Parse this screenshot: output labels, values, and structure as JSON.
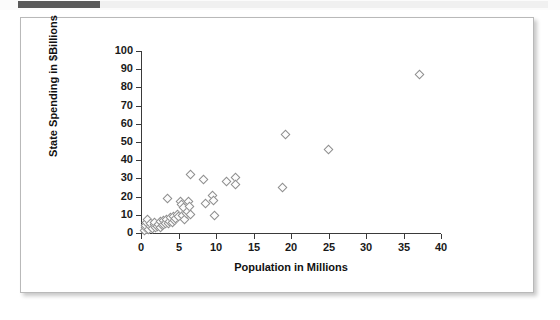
{
  "header": {
    "strip_label": ""
  },
  "chart_data": {
    "type": "scatter",
    "title": "",
    "xlabel": "Population in Millions",
    "ylabel": "State Spending in $Billions",
    "xlim": [
      0,
      40
    ],
    "ylim": [
      0,
      100
    ],
    "xticks": [
      0,
      5,
      10,
      15,
      20,
      25,
      30,
      35,
      40
    ],
    "yticks": [
      0,
      10,
      20,
      30,
      40,
      50,
      60,
      70,
      80,
      90,
      100
    ],
    "grid": false,
    "legend": null,
    "marker": "open-diamond",
    "marker_color": "#8e8e8e",
    "points": [
      {
        "x": 0.5,
        "y": 1.2
      },
      {
        "x": 0.6,
        "y": 2.6
      },
      {
        "x": 0.7,
        "y": 4.0
      },
      {
        "x": 0.8,
        "y": 5.3
      },
      {
        "x": 0.9,
        "y": 7.4
      },
      {
        "x": 1.1,
        "y": 1.8
      },
      {
        "x": 1.3,
        "y": 3.2
      },
      {
        "x": 1.3,
        "y": 5.0
      },
      {
        "x": 1.6,
        "y": 2.2
      },
      {
        "x": 1.8,
        "y": 4.2
      },
      {
        "x": 1.8,
        "y": 5.6
      },
      {
        "x": 2.0,
        "y": 2.8
      },
      {
        "x": 2.2,
        "y": 3.4
      },
      {
        "x": 2.4,
        "y": 4.6
      },
      {
        "x": 2.6,
        "y": 2.5
      },
      {
        "x": 2.7,
        "y": 5.8
      },
      {
        "x": 2.9,
        "y": 3.8
      },
      {
        "x": 3.0,
        "y": 6.4
      },
      {
        "x": 3.1,
        "y": 4.4
      },
      {
        "x": 3.3,
        "y": 5.2
      },
      {
        "x": 3.5,
        "y": 7.0
      },
      {
        "x": 3.6,
        "y": 18.6
      },
      {
        "x": 3.7,
        "y": 4.8
      },
      {
        "x": 3.8,
        "y": 6.0
      },
      {
        "x": 4.0,
        "y": 8.2
      },
      {
        "x": 4.2,
        "y": 5.4
      },
      {
        "x": 4.4,
        "y": 9.0
      },
      {
        "x": 4.5,
        "y": 6.8
      },
      {
        "x": 4.7,
        "y": 7.8
      },
      {
        "x": 4.9,
        "y": 10.0
      },
      {
        "x": 5.1,
        "y": 8.6
      },
      {
        "x": 5.3,
        "y": 16.8
      },
      {
        "x": 5.4,
        "y": 15.2
      },
      {
        "x": 5.6,
        "y": 9.4
      },
      {
        "x": 5.7,
        "y": 13.6
      },
      {
        "x": 5.9,
        "y": 7.2
      },
      {
        "x": 6.1,
        "y": 10.6
      },
      {
        "x": 6.3,
        "y": 11.8
      },
      {
        "x": 6.4,
        "y": 17.0
      },
      {
        "x": 6.5,
        "y": 14.2
      },
      {
        "x": 6.6,
        "y": 31.8
      },
      {
        "x": 6.7,
        "y": 9.8
      },
      {
        "x": 8.4,
        "y": 29.0
      },
      {
        "x": 8.6,
        "y": 16.2
      },
      {
        "x": 9.6,
        "y": 20.2
      },
      {
        "x": 9.7,
        "y": 17.4
      },
      {
        "x": 9.8,
        "y": 9.2
      },
      {
        "x": 11.5,
        "y": 27.8
      },
      {
        "x": 12.6,
        "y": 30.4
      },
      {
        "x": 12.7,
        "y": 26.4
      },
      {
        "x": 18.9,
        "y": 25.0
      },
      {
        "x": 19.3,
        "y": 54.0
      },
      {
        "x": 25.1,
        "y": 45.4
      },
      {
        "x": 37.2,
        "y": 86.8
      }
    ]
  }
}
